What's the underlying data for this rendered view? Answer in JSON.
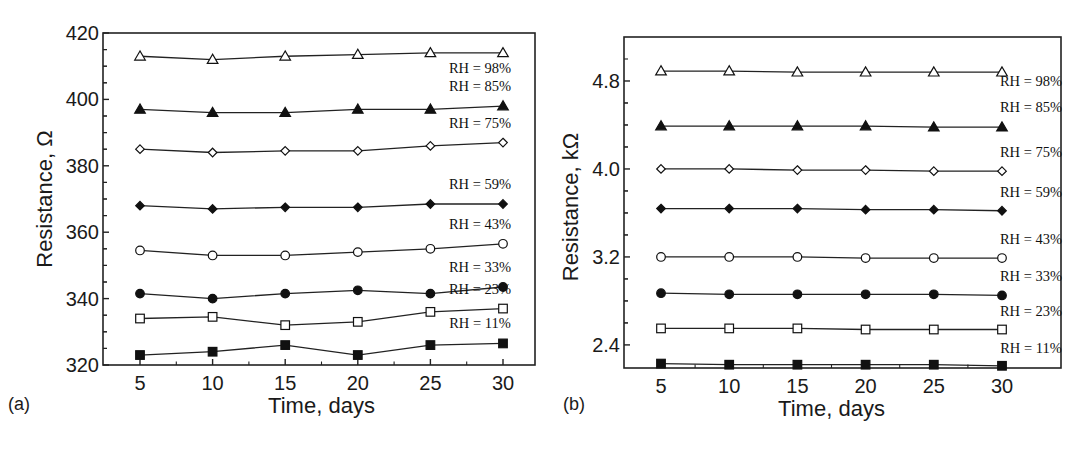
{
  "chart_data": [
    {
      "type": "line",
      "panel": "(a)",
      "title": "",
      "xlabel": "Time, days",
      "ylabel": "Resistance, Ω",
      "x": [
        5,
        10,
        15,
        20,
        25,
        30
      ],
      "xticks": [
        "5",
        "10",
        "15",
        "20",
        "25",
        "30"
      ],
      "yticks": [
        "320",
        "340",
        "360",
        "380",
        "400",
        "420"
      ],
      "ylim": [
        320,
        420
      ],
      "xlim": [
        2.5,
        32.5
      ],
      "grid": false,
      "legend_position": "inline-right",
      "series": [
        {
          "name": "RH = 98%",
          "marker": "triangle-open",
          "values": [
            413,
            412,
            413,
            413.5,
            414,
            414
          ]
        },
        {
          "name": "RH = 85%",
          "marker": "triangle-filled",
          "values": [
            397,
            396,
            396,
            397,
            397,
            398
          ]
        },
        {
          "name": "RH = 75%",
          "marker": "diamond-open",
          "values": [
            385,
            384,
            384.5,
            384.5,
            386,
            387
          ]
        },
        {
          "name": "RH = 59%",
          "marker": "diamond-filled",
          "values": [
            368,
            367,
            367.5,
            367.5,
            368.5,
            368.5
          ]
        },
        {
          "name": "RH = 43%",
          "marker": "circle-open",
          "values": [
            354.5,
            353,
            353,
            354,
            355,
            356.5
          ]
        },
        {
          "name": "RH = 33%",
          "marker": "circle-filled",
          "values": [
            341.5,
            340,
            341.5,
            342.5,
            341.5,
            343.5
          ]
        },
        {
          "name": "RH = 23%",
          "marker": "square-open",
          "values": [
            334,
            334.5,
            332,
            333,
            336,
            337
          ]
        },
        {
          "name": "RH = 11%",
          "marker": "square-filled",
          "values": [
            323,
            324,
            326,
            323,
            326,
            326.5
          ]
        }
      ]
    },
    {
      "type": "line",
      "panel": "(b)",
      "title": "",
      "xlabel": "Time, days",
      "ylabel": "Resistance, kΩ",
      "x": [
        5,
        10,
        15,
        20,
        25,
        30
      ],
      "xticks": [
        "5",
        "10",
        "15",
        "20",
        "25",
        "30"
      ],
      "yticks": [
        "2.4",
        "3.2",
        "4.0",
        "4.8"
      ],
      "ylim": [
        2.19,
        5.2
      ],
      "xlim": [
        2.3,
        33.4
      ],
      "grid": false,
      "legend_position": "inline-right",
      "series": [
        {
          "name": "RH = 98%",
          "marker": "triangle-open",
          "values": [
            4.89,
            4.89,
            4.88,
            4.88,
            4.88,
            4.88
          ]
        },
        {
          "name": "RH = 85%",
          "marker": "triangle-filled",
          "values": [
            4.39,
            4.39,
            4.39,
            4.39,
            4.38,
            4.38
          ]
        },
        {
          "name": "RH = 75%",
          "marker": "diamond-open",
          "values": [
            4.0,
            4.0,
            3.99,
            3.99,
            3.98,
            3.98
          ]
        },
        {
          "name": "RH = 59%",
          "marker": "diamond-filled",
          "values": [
            3.64,
            3.64,
            3.64,
            3.63,
            3.63,
            3.62
          ]
        },
        {
          "name": "RH = 43%",
          "marker": "circle-open",
          "values": [
            3.2,
            3.2,
            3.2,
            3.19,
            3.19,
            3.19
          ]
        },
        {
          "name": "RH = 33%",
          "marker": "circle-filled",
          "values": [
            2.87,
            2.86,
            2.86,
            2.86,
            2.86,
            2.85
          ]
        },
        {
          "name": "RH = 23%",
          "marker": "square-open",
          "values": [
            2.55,
            2.55,
            2.55,
            2.54,
            2.54,
            2.54
          ]
        },
        {
          "name": "RH = 11%",
          "marker": "square-filled",
          "values": [
            2.23,
            2.22,
            2.22,
            2.22,
            2.22,
            2.21
          ]
        }
      ]
    }
  ]
}
